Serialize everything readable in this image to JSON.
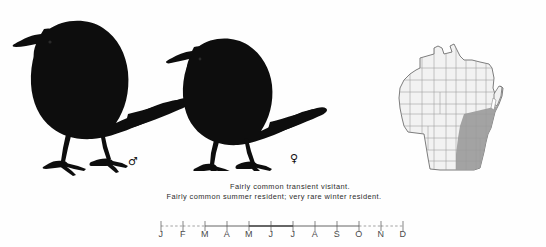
{
  "page": {
    "background_color": "#fefefe",
    "ink_color": "#111111"
  },
  "plate": {
    "name": "bird-silhouette-plate",
    "figures": [
      {
        "name": "bird-male",
        "sex_symbol": "♂",
        "sex_label": "male",
        "fill_color": "#0d0d0d"
      },
      {
        "name": "bird-female",
        "sex_symbol": "♀",
        "sex_label": "female",
        "fill_color": "#0d0d0d"
      }
    ]
  },
  "status": {
    "line1": "Fairly common transient visitant.",
    "line2": "Fairly common summer resident; very rare winter resident."
  },
  "map": {
    "name": "wisconsin-range-map",
    "region_label": "Wisconsin",
    "outline_color": "#6e6e6e",
    "county_line_color": "#9a9a9a",
    "unshaded_fill": "#f2f2f2",
    "shaded_fill": "#9e9e9e",
    "shaded_region": "southeastern Wisconsin"
  },
  "chart_data": {
    "type": "bar",
    "name": "seasonal-occurrence-bar",
    "title": "",
    "xlabel": "",
    "ylabel": "",
    "categories": [
      "J",
      "F",
      "M",
      "A",
      "M",
      "J",
      "J",
      "A",
      "S",
      "O",
      "N",
      "D"
    ],
    "category_names": [
      "January",
      "February",
      "March",
      "April",
      "May",
      "June",
      "July",
      "August",
      "September",
      "October",
      "November",
      "December"
    ],
    "values": [
      1,
      1,
      2,
      2,
      4,
      3,
      3,
      2,
      2,
      2,
      1,
      1
    ],
    "value_meaning": {
      "0": "absent",
      "1": "very rare (dashed hairline)",
      "2": "uncommon (thin line)",
      "3": "fairly common (medium line)",
      "4": "common (thick line)"
    },
    "ylim": [
      0,
      4
    ],
    "grid": false,
    "legend": "none",
    "axis_tick_count": 12,
    "segments": [
      {
        "from": "J",
        "to": "F",
        "weight": 1,
        "style": "dashed"
      },
      {
        "from": "F",
        "to": "M",
        "weight": 1,
        "style": "dashed"
      },
      {
        "from": "M",
        "to": "M",
        "weight": 2,
        "style": "solid"
      },
      {
        "from": "M",
        "to": "J",
        "weight": 4,
        "style": "solid"
      },
      {
        "from": "J",
        "to": "O",
        "weight": 2,
        "style": "solid"
      },
      {
        "from": "O",
        "to": "D",
        "weight": 1,
        "style": "dashed"
      }
    ]
  }
}
